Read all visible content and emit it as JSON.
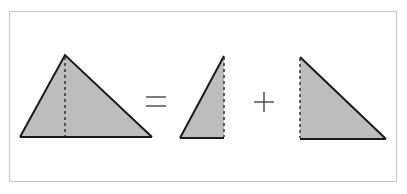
{
  "diagram": {
    "colors": {
      "fill": "#bdbdbd",
      "stroke": "#1a1a1a",
      "frame": "#c8c8c8",
      "background": "#ffffff"
    },
    "operators": {
      "equals": "=",
      "plus": "+"
    },
    "shapes": [
      {
        "name": "whole-triangle",
        "points": "20,137 65,55 152,137",
        "altitude_x": 65
      },
      {
        "name": "left-right-triangle",
        "points": "180,138 224,56 224,138",
        "dashed_side": "right"
      },
      {
        "name": "right-right-triangle",
        "points": "300,57 300,139 386,139",
        "dashed_side": "left"
      }
    ]
  }
}
